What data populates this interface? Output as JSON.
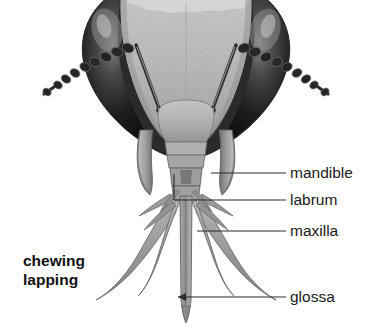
{
  "figure": {
    "background_color": "#ffffff",
    "mode_label": {
      "line1": "chewing",
      "line2": "lapping"
    },
    "labels": [
      {
        "id": "mandible",
        "text": "mandible"
      },
      {
        "id": "labrum",
        "text": "labrum"
      },
      {
        "id": "maxilla",
        "text": "maxilla"
      },
      {
        "id": "glossa",
        "text": "glossa"
      }
    ],
    "colors": {
      "eye_dark": "#1d1d1d",
      "eye_highlight": "#6e6e6e",
      "face_plate": "#bdbdbd",
      "mouthpart_gray": "#9a9a9a",
      "outline": "#3a3a3a",
      "leader_line": "#2b2b2b",
      "text": "#1a1a1a"
    }
  }
}
